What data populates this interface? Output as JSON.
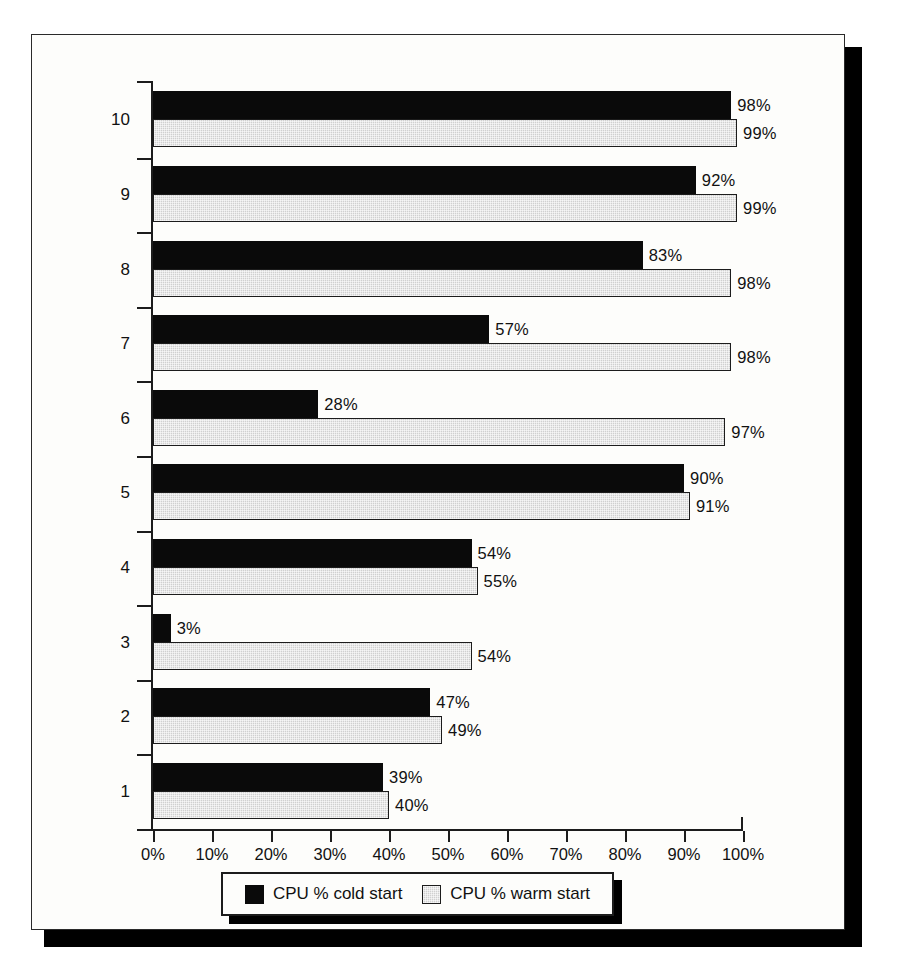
{
  "chart_data": {
    "type": "bar",
    "orientation": "horizontal",
    "title": "",
    "xlabel": "",
    "ylabel": "",
    "xlim": [
      0,
      100
    ],
    "xticks": [
      "0%",
      "10%",
      "20%",
      "30%",
      "40%",
      "50%",
      "60%",
      "70%",
      "80%",
      "90%",
      "100%"
    ],
    "grid": false,
    "legend_position": "bottom",
    "categories": [
      "1",
      "2",
      "3",
      "4",
      "5",
      "6",
      "7",
      "8",
      "9",
      "10"
    ],
    "series": [
      {
        "name": "CPU % cold start",
        "color": "#0a0a0a",
        "values": [
          39,
          47,
          3,
          54,
          90,
          28,
          57,
          83,
          92,
          98
        ],
        "labels": [
          "39%",
          "47%",
          "3%",
          "54%",
          "90%",
          "28%",
          "57%",
          "83%",
          "92%",
          "98%"
        ]
      },
      {
        "name": "CPU % warm start",
        "color": "#d0d0d0",
        "values": [
          40,
          49,
          54,
          55,
          91,
          97,
          98,
          98,
          99,
          99
        ],
        "labels": [
          "40%",
          "49%",
          "54%",
          "55%",
          "91%",
          "97%",
          "98%",
          "98%",
          "99%",
          "99%"
        ]
      }
    ]
  },
  "legend": {
    "entries": [
      {
        "label": "CPU % cold start",
        "swatch": "black-square-icon"
      },
      {
        "label": "CPU % warm start",
        "swatch": "gray-square-icon"
      }
    ]
  }
}
